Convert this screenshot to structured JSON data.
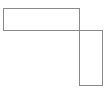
{
  "canvas": {
    "width": 110,
    "height": 100,
    "background_color": "#ffffff"
  },
  "diagram": {
    "title": "",
    "stroke_color": "#8a8a8a",
    "stroke_width": 1,
    "fill_color": "#ffffff",
    "shapes": [
      {
        "name": "horizontal-rectangle",
        "type": "rect",
        "x": 3.5,
        "y": 8.5,
        "width": 76,
        "height": 22,
        "stroke": "#8a8a8a",
        "fill": "#ffffff",
        "stroke_width": 1
      },
      {
        "name": "vertical-rectangle",
        "type": "rect",
        "x": 79.5,
        "y": 30.5,
        "width": 23,
        "height": 55,
        "stroke": "#8a8a8a",
        "fill": "#ffffff",
        "stroke_width": 1
      }
    ]
  }
}
